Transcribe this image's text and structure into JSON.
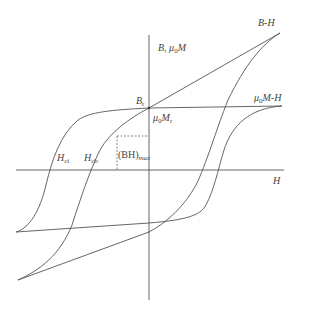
{
  "diagram": {
    "type": "hysteresis-loop",
    "axes": {
      "x_label": "H",
      "y_label_main": "B, μ",
      "y_label_sub": "0",
      "y_label_tail": "M"
    },
    "curves": [
      {
        "name": "B-H",
        "label": "B-H"
      },
      {
        "name": "mu0M-H",
        "label_main": "μ",
        "label_sub": "0",
        "label_tail": "M-H"
      }
    ],
    "points": {
      "Br": {
        "main": "B",
        "sub": "r"
      },
      "mu0Mr": {
        "main": "μ",
        "sub0": "0",
        "mid": "M",
        "sub": "r"
      },
      "Hci": {
        "main": "H",
        "sub": "ci"
      },
      "Hcb": {
        "main": "H",
        "sub": "cb"
      },
      "BHmax": {
        "main": "(BH)",
        "sub": "max"
      }
    },
    "colors": {
      "line": "#555555",
      "background": "#ffffff"
    }
  }
}
